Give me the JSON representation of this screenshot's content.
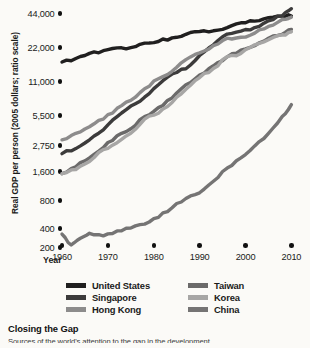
{
  "chart_data": {
    "type": "line",
    "title": "Closing the Gap",
    "xlabel": "Year",
    "ylabel": "Real GDP per person (2005 dollars; ratio scale)",
    "scale": "log",
    "grid": false,
    "legend_position": "bottom",
    "xlim": [
      1960,
      2011
    ],
    "ylim": [
      200,
      50000
    ],
    "xticks": [
      1960,
      1970,
      1980,
      1990,
      2000,
      2010
    ],
    "xtick_labels": [
      "1960",
      "1970",
      "1980",
      "1990",
      "2000",
      "2010"
    ],
    "yticks": [
      200,
      400,
      800,
      1600,
      2750,
      5500,
      11000,
      22000,
      44000
    ],
    "ytick_labels": [
      "200",
      "400",
      "800",
      "1,600",
      "2,750",
      "5,500",
      "11,000",
      "22,000",
      "44,000"
    ],
    "series": [
      {
        "name": "United States",
        "color": "#201f1f",
        "x": [
          1960,
          1963,
          1966,
          1969,
          1972,
          1975,
          1978,
          1981,
          1984,
          1987,
          1990,
          1993,
          1996,
          1999,
          2002,
          2005,
          2008,
          2010
        ],
        "values": [
          16200,
          17400,
          19300,
          20400,
          21600,
          21700,
          23800,
          24600,
          26500,
          28500,
          30200,
          30600,
          32700,
          36000,
          37300,
          40000,
          41300,
          41400
        ]
      },
      {
        "name": "Singapore",
        "color": "#3c3b3b",
        "x": [
          1960,
          1963,
          1966,
          1969,
          1972,
          1975,
          1978,
          1981,
          1984,
          1987,
          1990,
          1993,
          1996,
          1999,
          2002,
          2005,
          2008,
          2010
        ],
        "values": [
          2300,
          2550,
          3100,
          3900,
          5300,
          6600,
          7900,
          10200,
          12700,
          14100,
          18500,
          23000,
          28600,
          30400,
          32700,
          37500,
          41500,
          48000
        ]
      },
      {
        "name": "Hong Kong",
        "color": "#8d8c8c",
        "x": [
          1960,
          1963,
          1966,
          1969,
          1972,
          1975,
          1978,
          1981,
          1984,
          1987,
          1990,
          1993,
          1996,
          1999,
          2002,
          2005,
          2008,
          2010
        ],
        "values": [
          3100,
          3600,
          4200,
          5000,
          6300,
          7400,
          9400,
          11500,
          13400,
          17000,
          19500,
          22600,
          26300,
          26800,
          29200,
          33500,
          38500,
          40500
        ]
      },
      {
        "name": "Taiwan",
        "color": "#6b6a6a",
        "x": [
          1960,
          1963,
          1966,
          1969,
          1972,
          1975,
          1978,
          1981,
          1984,
          1987,
          1990,
          1993,
          1996,
          1999,
          2002,
          2005,
          2008,
          2010
        ],
        "values": [
          1500,
          1750,
          2100,
          2600,
          3400,
          4000,
          5300,
          6400,
          7800,
          10200,
          12400,
          15000,
          18000,
          20600,
          22600,
          26300,
          28500,
          31500
        ]
      },
      {
        "name": "Korea",
        "color": "#a7a6a5",
        "x": [
          1960,
          1963,
          1966,
          1969,
          1972,
          1975,
          1978,
          1981,
          1984,
          1987,
          1990,
          1993,
          1996,
          1999,
          2002,
          2005,
          2008,
          2010
        ],
        "values": [
          1500,
          1650,
          1950,
          2500,
          2900,
          3600,
          5000,
          5700,
          7100,
          9300,
          11800,
          14200,
          18100,
          19300,
          23000,
          25500,
          28200,
          30000
        ]
      },
      {
        "name": "China",
        "color": "#757474",
        "x": [
          1960,
          1962,
          1964,
          1966,
          1969,
          1972,
          1975,
          1978,
          1981,
          1984,
          1987,
          1990,
          1993,
          1996,
          1999,
          2002,
          2005,
          2008,
          2010
        ],
        "values": [
          320,
          215,
          275,
          330,
          300,
          360,
          400,
          440,
          520,
          660,
          830,
          950,
          1250,
          1700,
          2100,
          2700,
          3600,
          5300,
          6800
        ]
      }
    ]
  },
  "legend": {
    "left": [
      {
        "label": "United States",
        "color": "#201f1f"
      },
      {
        "label": "Singapore",
        "color": "#3c3b3b"
      },
      {
        "label": "Hong Kong",
        "color": "#8d8c8c"
      }
    ],
    "right": [
      {
        "label": "Taiwan",
        "color": "#6b6a6a"
      },
      {
        "label": "Korea",
        "color": "#a7a6a5"
      },
      {
        "label": "China",
        "color": "#757474"
      }
    ]
  },
  "caption": {
    "title": "Closing the Gap",
    "source": "Sources of the world's attention to the gap in the development"
  }
}
